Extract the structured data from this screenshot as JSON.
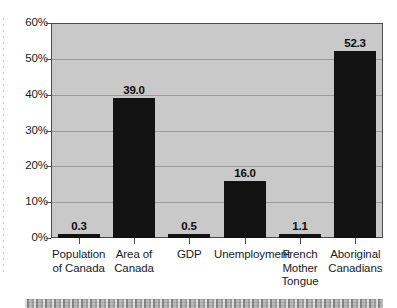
{
  "chart_data": {
    "type": "bar",
    "title": "",
    "xlabel": "",
    "ylabel": "",
    "ylim": [
      0,
      60
    ],
    "grid": true,
    "legend": false,
    "categories": [
      "Population of Canada",
      "Area of Canada",
      "GDP",
      "Unemployment",
      "French Mother Tongue",
      "Aboriginal Canadians"
    ],
    "category_lines": [
      [
        "Population",
        "of Canada"
      ],
      [
        "Area of",
        "Canada"
      ],
      [
        "GDP"
      ],
      [
        "Unemployment"
      ],
      [
        "French",
        "Mother",
        "Tongue"
      ],
      [
        "Aboriginal",
        "Canadians"
      ]
    ],
    "values": [
      0.3,
      39.0,
      0.5,
      16.0,
      1.1,
      52.3
    ],
    "value_labels": [
      "0.3",
      "39.0",
      "0.5",
      "16.0",
      "1.1",
      "52.3"
    ],
    "ytick_labels": [
      "60%",
      "50%",
      "40%",
      "30%",
      "20%",
      "10%",
      "0%"
    ],
    "ytick_values": [
      60,
      50,
      40,
      30,
      20,
      10,
      0
    ],
    "colors": {
      "bar": "#121212",
      "plot_background": "#c9c9c9",
      "gridline": "#9a9a9a",
      "axis": "#4b4b4b",
      "text": "#1b1b1b",
      "page_background": "#ffffff"
    }
  }
}
